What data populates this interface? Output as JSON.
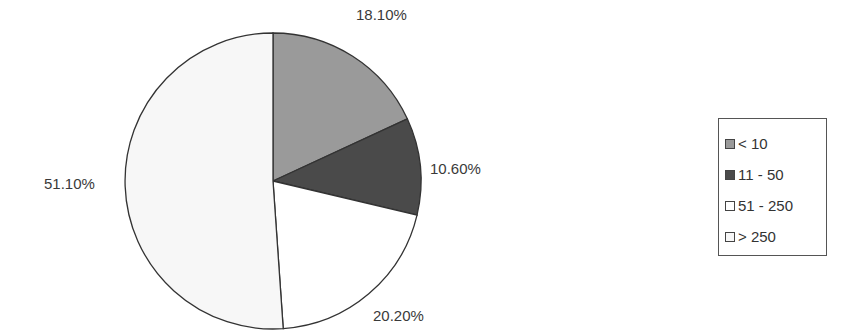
{
  "chart_data": {
    "type": "pie",
    "title": "",
    "categories": [
      "< 10",
      "11 - 50",
      "51 - 250",
      "> 250"
    ],
    "values": [
      18.1,
      10.6,
      20.2,
      51.1
    ],
    "labels": [
      "18.10%",
      "10.60%",
      "20.20%",
      "51.10%"
    ],
    "colors": [
      "#9a9a9a",
      "#4a4a4a",
      "#ffffff",
      "#f7f7f7"
    ],
    "start_angle": "12 o'clock",
    "direction": "clockwise",
    "legend_position": "right"
  },
  "legend": {
    "items": [
      {
        "label": "< 10",
        "color": "#9a9a9a"
      },
      {
        "label": "11 - 50",
        "color": "#4a4a4a"
      },
      {
        "label": "51 - 250",
        "color": "#ffffff"
      },
      {
        "label": "> 250",
        "color": "#f7f7f7"
      }
    ]
  }
}
